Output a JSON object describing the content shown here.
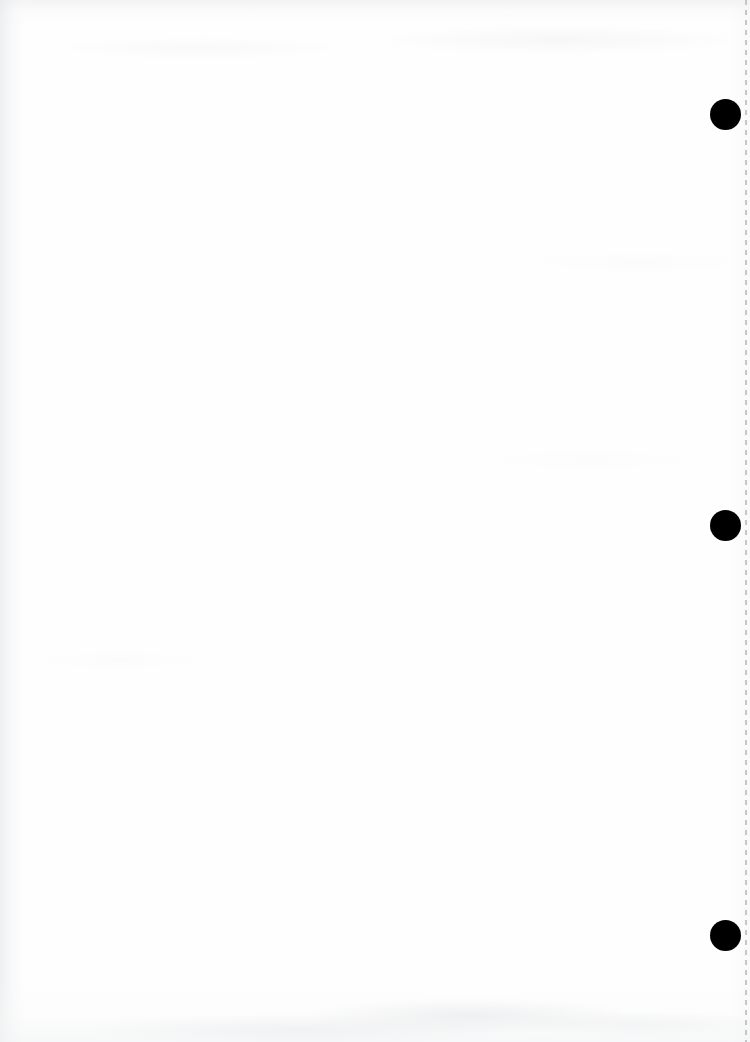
{
  "document": {
    "kind": "scanned-page",
    "page_content_text": "",
    "background_color": "#fefefe",
    "page_width": 750,
    "page_height": 1042
  },
  "margin_marks": {
    "label": "punch-hole-marks",
    "color": "#000000",
    "diameter": 31,
    "holes": [
      {
        "id": "hole-1",
        "center_x": 725,
        "center_y": 114
      },
      {
        "id": "hole-2",
        "center_x": 725,
        "center_y": 525
      },
      {
        "id": "hole-3",
        "center_x": 725,
        "center_y": 935
      }
    ]
  },
  "perforation": {
    "label": "perforation-guide-line",
    "color": "#c4c6c8",
    "x": 745,
    "dash_length": 5,
    "gap_length": 5
  },
  "scan_artifacts": {
    "left_edge_shadow_color": "#e2e4e6",
    "top_edge_shadow_color": "#e7e8ea",
    "bottom_edge_shadow_color": "#f3f4f5",
    "noise_color": "#e4e5e7"
  }
}
